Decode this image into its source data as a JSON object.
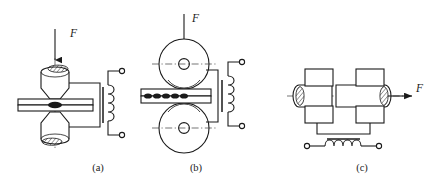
{
  "figure": {
    "type": "engineering-line-diagram",
    "background_color": "#ffffff",
    "line_color": "#1a1a1a",
    "width": 433,
    "height": 186,
    "panels": [
      {
        "id": "a",
        "caption": "(a)",
        "caption_x": 98,
        "caption_y": 171,
        "process": "spot-welding",
        "force_label": "F",
        "force_label_x": 70,
        "force_label_y": 37,
        "parts": {
          "upper_electrode": "upper-electrode",
          "lower_electrode": "lower-electrode",
          "workpiece": "workpiece-strip",
          "nugget": "weld-nugget",
          "transformer": "welding-transformer",
          "terminals": 2
        }
      },
      {
        "id": "b",
        "caption": "(b)",
        "caption_x": 196,
        "caption_y": 171,
        "process": "seam-welding",
        "force_label": "F",
        "force_label_x": 192,
        "force_label_y": 22,
        "parts": {
          "upper_roller": "upper-roller-electrode",
          "lower_roller": "lower-roller-electrode",
          "workpiece": "workpiece-strip",
          "nugget_count": 6,
          "transformer": "welding-transformer",
          "terminals": 2
        }
      },
      {
        "id": "c",
        "caption": "(c)",
        "caption_x": 362,
        "caption_y": 171,
        "process": "butt-welding",
        "force_label": "F",
        "force_label_x": 416,
        "force_label_y": 89,
        "parts": {
          "left_clamp_upper": "left-upper-clamp",
          "left_clamp_lower": "left-lower-clamp",
          "right_clamp_upper": "right-upper-clamp",
          "right_clamp_lower": "right-lower-clamp",
          "left_workpiece": "left-workpiece-bar",
          "right_workpiece": "right-workpiece-bar",
          "transformer": "welding-transformer",
          "terminals": 2
        }
      }
    ]
  }
}
